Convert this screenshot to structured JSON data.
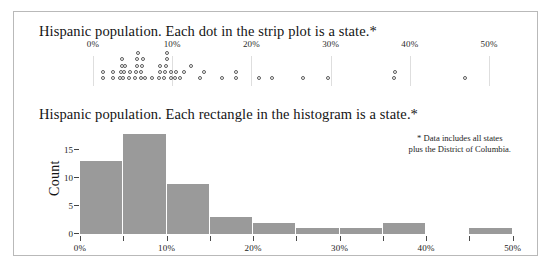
{
  "figure": {
    "strip_panel": {
      "title": "Hispanic population. Each dot in the strip plot is a state.*"
    },
    "hist_panel": {
      "title": "Hispanic population. Each rectangle in the histogram is a state.*",
      "footnote": "* Data includes all states\nplus the District of Columbia."
    }
  },
  "chart_data": [
    {
      "type": "scatter",
      "name": "strip-plot",
      "title": "Hispanic population. Each dot in the strip plot is a state.*",
      "xlabel": "",
      "ylabel": "",
      "xlim": [
        0,
        52
      ],
      "xtick_labels": [
        "0%",
        "10%",
        "20%",
        "30%",
        "40%",
        "50%"
      ],
      "xticks": [
        0,
        10,
        20,
        30,
        40,
        50
      ],
      "grid": true,
      "x": [
        1.3,
        1.3,
        2.5,
        2.5,
        3.4,
        3.5,
        3.6,
        3.7,
        3.8,
        3.9,
        4.0,
        4.6,
        4.7,
        5.3,
        5.4,
        5.5,
        5.6,
        5.7,
        6.0,
        6.1,
        6.2,
        6.3,
        6.5,
        7.5,
        8.3,
        8.4,
        8.5,
        9.0,
        9.1,
        9.2,
        9.3,
        9.4,
        9.8,
        9.9,
        10.4,
        10.5,
        11.0,
        11.5,
        12.4,
        13.5,
        14.0,
        16.3,
        18.0,
        18.1,
        20.9,
        22.6,
        26.5,
        29.6,
        38.0,
        38.1,
        47.0
      ],
      "jitter_rows": [
        0,
        1,
        0,
        1,
        0,
        1,
        2,
        3,
        0,
        1,
        2,
        0,
        1,
        0,
        1,
        2,
        3,
        4,
        0,
        1,
        2,
        3,
        0,
        0,
        0,
        1,
        2,
        0,
        1,
        2,
        3,
        4,
        0,
        1,
        0,
        1,
        0,
        1,
        2,
        0,
        1,
        0,
        0,
        1,
        0,
        0,
        0,
        0,
        0,
        1,
        0
      ]
    },
    {
      "type": "bar",
      "name": "histogram",
      "title": "Hispanic population. Each rectangle in the histogram is a state.*",
      "xlabel": "",
      "ylabel": "Count",
      "ylim": [
        0,
        19
      ],
      "yticks": [
        0,
        5,
        10,
        15
      ],
      "ytick_labels": [
        "0",
        "5",
        "10",
        "15"
      ],
      "xlim": [
        0,
        52
      ],
      "xticks": [
        0,
        5,
        10,
        15,
        20,
        25,
        30,
        35,
        40,
        45,
        50
      ],
      "xtick_labels": [
        "0%",
        "",
        "10%",
        "",
        "20%",
        "",
        "30%",
        "",
        "40%",
        "",
        "50%"
      ],
      "xtick_major": [
        0,
        10,
        20,
        30,
        40,
        50
      ],
      "bin_width": 5,
      "bins": [
        {
          "start": 0,
          "end": 5,
          "count": 13
        },
        {
          "start": 5,
          "end": 10,
          "count": 18
        },
        {
          "start": 10,
          "end": 15,
          "count": 9
        },
        {
          "start": 15,
          "end": 20,
          "count": 3
        },
        {
          "start": 20,
          "end": 25,
          "count": 2
        },
        {
          "start": 25,
          "end": 30,
          "count": 1
        },
        {
          "start": 30,
          "end": 35,
          "count": 1
        },
        {
          "start": 35,
          "end": 40,
          "count": 2
        },
        {
          "start": 40,
          "end": 45,
          "count": 0
        },
        {
          "start": 45,
          "end": 50,
          "count": 1
        }
      ],
      "bar_color": "#9a9a9a",
      "grid": false
    }
  ]
}
